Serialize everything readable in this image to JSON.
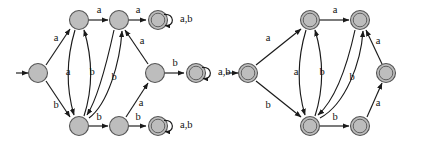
{
  "figure": {
    "kind": "finite-automaton-diagram-pair",
    "background_color": "#ffffff",
    "node_fill_color": "#bdbdbd",
    "node_stroke_color": "#555555",
    "edge_color": "#1a1a1a",
    "label_color": "#111111",
    "alphabet": [
      "a",
      "b"
    ]
  },
  "diagrams": [
    {
      "id": "left-automaton",
      "name": "left-automaton",
      "start_arrow": true,
      "nodes": [
        {
          "id": "L0",
          "name": "left-start-state",
          "x": 38,
          "y": 73,
          "type": "plain",
          "accepting": false
        },
        {
          "id": "L1",
          "name": "left-top-state",
          "x": 79,
          "y": 20,
          "type": "plain",
          "accepting": false
        },
        {
          "id": "L2",
          "name": "left-top-mid-state",
          "x": 119,
          "y": 20,
          "type": "plain",
          "accepting": false
        },
        {
          "id": "L3",
          "name": "left-top-accepting-state",
          "x": 158,
          "y": 20,
          "type": "double",
          "accepting": true
        },
        {
          "id": "L4",
          "name": "left-right-mid-state",
          "x": 155,
          "y": 73,
          "type": "plain",
          "accepting": false
        },
        {
          "id": "L5",
          "name": "left-mid-accepting-state",
          "x": 196,
          "y": 73,
          "type": "double",
          "accepting": true
        },
        {
          "id": "L6",
          "name": "left-bottom-state",
          "x": 79,
          "y": 126,
          "type": "plain",
          "accepting": false
        },
        {
          "id": "L7",
          "name": "left-bottom-mid-state",
          "x": 119,
          "y": 126,
          "type": "plain",
          "accepting": false
        },
        {
          "id": "L8",
          "name": "left-bottom-accepting-state",
          "x": 158,
          "y": 126,
          "type": "double",
          "accepting": true
        }
      ],
      "edges": [
        {
          "name": "edge-L0-L1",
          "from": "L0",
          "to": "L1",
          "label": "a",
          "label_x": 56,
          "label_y": 39
        },
        {
          "name": "edge-L0-L6",
          "from": "L0",
          "to": "L6",
          "label": "b",
          "label_x": 56,
          "label_y": 106
        },
        {
          "name": "edge-L1-L2",
          "from": "L1",
          "to": "L2",
          "label": "a",
          "label_x": 99,
          "label_y": 11
        },
        {
          "name": "edge-L2-L3",
          "from": "L2",
          "to": "L3",
          "label": "a",
          "label_x": 138,
          "label_y": 11
        },
        {
          "name": "edge-L1-L6",
          "from": "L1",
          "to": "L6",
          "label": "a",
          "label_x": 68,
          "label_y": 73
        },
        {
          "name": "edge-L6-L1",
          "from": "L6",
          "to": "L1",
          "label": "b",
          "label_x": 92,
          "label_y": 73
        },
        {
          "name": "edge-L2-L6",
          "from": "L2",
          "to": "L6",
          "label": "b",
          "label_x": 114,
          "label_y": 78
        },
        {
          "name": "edge-L6-L2",
          "from": "L6",
          "to": "L2",
          "label": "",
          "label_x": 0,
          "label_y": 0
        },
        {
          "name": "edge-L4-L2",
          "from": "L4",
          "to": "L2",
          "label": "a",
          "label_x": 142,
          "label_y": 42
        },
        {
          "name": "edge-L4-L5",
          "from": "L4",
          "to": "L5",
          "label": "b",
          "label_x": 175,
          "label_y": 64
        },
        {
          "name": "edge-L7-L4",
          "from": "L7",
          "to": "L4",
          "label": "a",
          "label_x": 141,
          "label_y": 104
        },
        {
          "name": "edge-L6-L7",
          "from": "L6",
          "to": "L7",
          "label": "b",
          "label_x": 99,
          "label_y": 118
        },
        {
          "name": "edge-L7-L8",
          "from": "L7",
          "to": "L8",
          "label": "b",
          "label_x": 138,
          "label_y": 118
        }
      ],
      "self_loops": [
        {
          "name": "self-loop-L3",
          "node": "L3",
          "label": "a,b",
          "label_x": 176,
          "label_y": 20
        },
        {
          "name": "self-loop-L5",
          "node": "L5",
          "label": "a,b",
          "label_x": 214,
          "label_y": 73
        },
        {
          "name": "self-loop-L8",
          "node": "L8",
          "label": "a,b",
          "label_x": 176,
          "label_y": 126
        }
      ]
    },
    {
      "id": "right-automaton",
      "name": "right-automaton",
      "start_arrow": true,
      "nodes": [
        {
          "id": "R0",
          "name": "right-start-state",
          "x": 248,
          "y": 73,
          "type": "double",
          "accepting": true
        },
        {
          "id": "R1",
          "name": "right-top-left-state",
          "x": 310,
          "y": 20,
          "type": "double",
          "accepting": true
        },
        {
          "id": "R2",
          "name": "right-top-right-state",
          "x": 360,
          "y": 20,
          "type": "double",
          "accepting": true
        },
        {
          "id": "R3",
          "name": "right-middle-right-state",
          "x": 386,
          "y": 73,
          "type": "double",
          "accepting": true
        },
        {
          "id": "R4",
          "name": "right-bottom-left-state",
          "x": 310,
          "y": 126,
          "type": "double",
          "accepting": true
        },
        {
          "id": "R5",
          "name": "right-bottom-right-state",
          "x": 360,
          "y": 126,
          "type": "double",
          "accepting": true
        }
      ],
      "edges": [
        {
          "name": "edge-R0-R1",
          "from": "R0",
          "to": "R1",
          "label": "a",
          "label_x": 268,
          "label_y": 39
        },
        {
          "name": "edge-R0-R4",
          "from": "R0",
          "to": "R4",
          "label": "b",
          "label_x": 268,
          "label_y": 106
        },
        {
          "name": "edge-R1-R2",
          "from": "R1",
          "to": "R2",
          "label": "a",
          "label_x": 335,
          "label_y": 11
        },
        {
          "name": "edge-R1-R4",
          "from": "R1",
          "to": "R4",
          "label": "a",
          "label_x": 296,
          "label_y": 73
        },
        {
          "name": "edge-R4-R1",
          "from": "R4",
          "to": "R1",
          "label": "b",
          "label_x": 322,
          "label_y": 73
        },
        {
          "name": "edge-R2-R4",
          "from": "R2",
          "to": "R4",
          "label": "b",
          "label_x": 352,
          "label_y": 78
        },
        {
          "name": "edge-R4-R2",
          "from": "R4",
          "to": "R2",
          "label": "",
          "label_x": 0,
          "label_y": 0
        },
        {
          "name": "edge-R3-R2",
          "from": "R3",
          "to": "R2",
          "label": "a",
          "label_x": 378,
          "label_y": 42
        },
        {
          "name": "edge-R5-R3",
          "from": "R5",
          "to": "R3",
          "label": "a",
          "label_x": 378,
          "label_y": 104
        },
        {
          "name": "edge-R4-R5",
          "from": "R4",
          "to": "R5",
          "label": "b",
          "label_x": 335,
          "label_y": 118
        }
      ],
      "self_loops": []
    }
  ],
  "labels": {
    "a": "a",
    "b": "b",
    "ab": "a,b"
  }
}
